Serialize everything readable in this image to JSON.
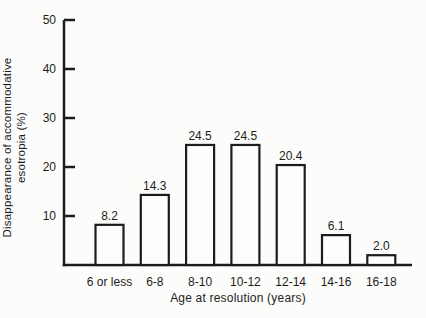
{
  "figure": {
    "background": "#fcfcfa",
    "ink_color": "#1c1c1c",
    "bar_fill": "#fdfdfc"
  },
  "chart_data": {
    "type": "bar",
    "title": "",
    "categories": [
      "6 or less",
      "6-8",
      "8-10",
      "10-12",
      "12-14",
      "14-16",
      "16-18"
    ],
    "values": [
      8.2,
      14.3,
      24.5,
      24.5,
      20.4,
      6.1,
      2.0
    ],
    "value_labels": [
      "8.2",
      "14.3",
      "24.5",
      "24.5",
      "20.4",
      "6.1",
      "2.0"
    ],
    "xlabel": "Age at resolution (years)",
    "ylabel_line1": "Disappearance of accommodative",
    "ylabel_line2": "esotropia (%)",
    "ylim": [
      0,
      50
    ],
    "yticks": [
      10,
      20,
      30,
      40,
      50
    ],
    "grid": false,
    "legend": null
  }
}
